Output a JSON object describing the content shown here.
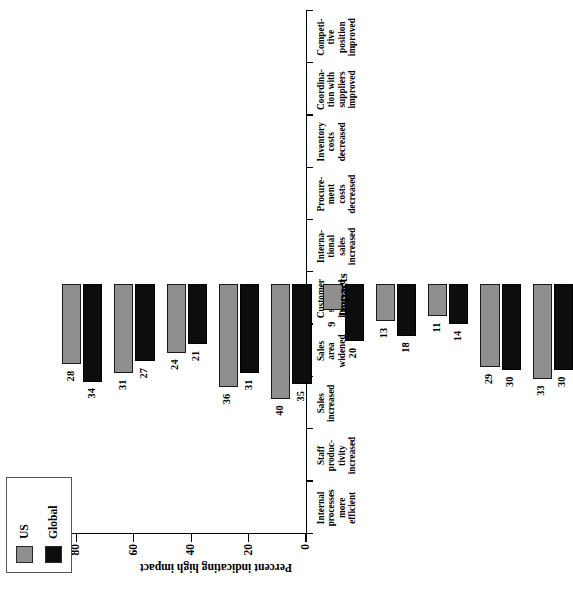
{
  "chart_data": {
    "type": "bar",
    "orientation": "vertical-rotated",
    "title": "",
    "xlabel": "Impacts",
    "ylabel": "Percent indicating high impact",
    "ylim": [
      0,
      100
    ],
    "yticks": [
      0,
      20,
      40,
      60,
      80,
      100
    ],
    "grid": false,
    "legend_position": "top-left",
    "categories": [
      "Internal processes more efficient",
      "Staff productivity increased",
      "Sales increased",
      "Sales area widened",
      "Customer service improved",
      "International sales increased",
      "Procurement costs decreased",
      "Inventory costs decreased",
      "Coordination with suppliers improved",
      "Competitive position improved"
    ],
    "category_lines": [
      [
        "Internal",
        "processes",
        "more",
        "efficient"
      ],
      [
        "Staff",
        "produc-",
        "tivity",
        "increased"
      ],
      [
        "Sales",
        "increased"
      ],
      [
        "Sales",
        "area",
        "widened"
      ],
      [
        "Customer",
        "service",
        "improved"
      ],
      [
        "Interna-",
        "tional",
        "sales",
        "increased"
      ],
      [
        "Procure-",
        "ment",
        "costs",
        "decreased"
      ],
      [
        "Inventory",
        "costs",
        "decreased"
      ],
      [
        "Coordina-",
        "tion with",
        "suppliers",
        "improved"
      ],
      [
        "Competi-",
        "tive",
        "position",
        "improved"
      ]
    ],
    "series": [
      {
        "name": "US",
        "color": "#8f8f8f",
        "values": [
          28,
          31,
          24,
          36,
          40,
          9,
          13,
          11,
          29,
          33
        ]
      },
      {
        "name": "Global",
        "color": "#0d0d0d",
        "values": [
          34,
          27,
          21,
          31,
          35,
          20,
          18,
          14,
          30,
          30
        ]
      }
    ]
  },
  "legend": {
    "items": [
      {
        "label": "US",
        "color": "#8f8f8f"
      },
      {
        "label": "Global",
        "color": "#0d0d0d"
      }
    ]
  }
}
